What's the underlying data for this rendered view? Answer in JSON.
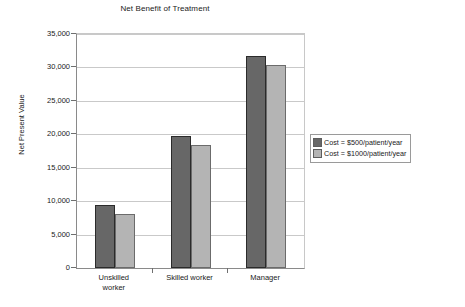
{
  "chart_data": {
    "type": "bar",
    "title": "Net Benefit of Treatment",
    "xlabel": "",
    "ylabel": "Net Present Value",
    "categories": [
      "Unskilled worker",
      "Skilled worker",
      "Manager"
    ],
    "series": [
      {
        "name": "Cost = $500/patient/year",
        "values": [
          9500,
          19700,
          31700
        ],
        "color": "#676767"
      },
      {
        "name": "Cost = $1000/patient/year",
        "values": [
          8100,
          18400,
          30300
        ],
        "color": "#b4b4b4"
      }
    ],
    "ylim": [
      0,
      35000
    ],
    "ytick_labels": [
      "35,000",
      "30,000",
      "25,000",
      "20,000",
      "15,000",
      "10,000",
      "5,000",
      "0"
    ],
    "ytick_values": [
      35000,
      30000,
      25000,
      20000,
      15000,
      10000,
      5000,
      0
    ],
    "ytick_step": 5000,
    "grid": true,
    "grid_axis": "y",
    "legend_position": "right",
    "category_label_lines": [
      [
        "Unskilled",
        "worker"
      ],
      [
        "Skilled worker"
      ],
      [
        "Manager"
      ]
    ]
  }
}
